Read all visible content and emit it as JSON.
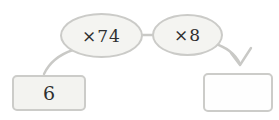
{
  "diagram": {
    "type": "multiplication-arrow-diagram",
    "start_box": {
      "value": "6"
    },
    "operations": [
      {
        "label": "×74"
      },
      {
        "label": "×8"
      }
    ],
    "result_box": {
      "value": ""
    },
    "colors": {
      "stroke": "#c9c9c6",
      "shape_fill": "#f4f4f1",
      "shape_border": "#cbcbc8",
      "result_fill": "#fefefe",
      "text": "#2f2f2f",
      "background": "#ffffff"
    }
  }
}
